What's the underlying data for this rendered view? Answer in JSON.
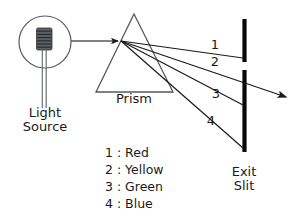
{
  "figure": {
    "title_visible": false,
    "background_color": "#ffffff",
    "ink_color": "#1a1a1a",
    "line_color": "#55595d"
  },
  "labels": {
    "light_source_line1": "Light",
    "light_source_line2": "Source",
    "prism": "Prism",
    "exit_slit_line1": "Exit",
    "exit_slit_line2": "Slit"
  },
  "ray_markers": {
    "one": "1",
    "two": "2",
    "three": "3",
    "four": "4"
  },
  "legend": {
    "items": [
      {
        "number": "1",
        "separator": ":",
        "color_name": "Red"
      },
      {
        "number": "2",
        "separator": ":",
        "color_name": "Yellow"
      },
      {
        "number": "3",
        "separator": ":",
        "color_name": "Green"
      },
      {
        "number": "4",
        "separator": ":",
        "color_name": "Blue"
      }
    ],
    "line1": "1 : Red",
    "line2": "2 : Yellow",
    "line3": "3 : Green",
    "line4": "4 : Blue"
  },
  "icons": {
    "light_bulb": "light-bulb-icon",
    "prism": "prism-icon",
    "exit_slit": "exit-slit-icon",
    "arrow_into_prism": "arrow-right-icon",
    "arrow_exit_beam": "arrow-right-icon"
  }
}
